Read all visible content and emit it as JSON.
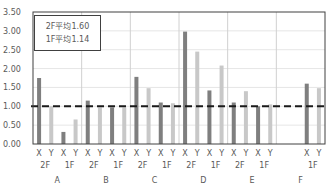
{
  "chart_data": {
    "type": "bar",
    "title": "",
    "xlabel": "",
    "ylabel": "",
    "ylim": [
      0,
      3.5
    ],
    "yticks": [
      "0.00",
      "0.50",
      "1.00",
      "1.50",
      "2.00",
      "2.50",
      "3.00",
      "3.50"
    ],
    "grid": true,
    "reference_line": {
      "value": 1.0,
      "style": "dashed",
      "color": "#1a1a1a"
    },
    "groups": [
      {
        "name": "A",
        "floors": [
          {
            "floor": "2F",
            "X": 1.75,
            "Y": 1.0
          },
          {
            "floor": "1F",
            "X": 0.32,
            "Y": 0.65
          }
        ]
      },
      {
        "name": "B",
        "floors": [
          {
            "floor": "2F",
            "X": 1.15,
            "Y": 0.97
          },
          {
            "floor": "1F",
            "X": 0.97,
            "Y": 0.97
          }
        ]
      },
      {
        "name": "C",
        "floors": [
          {
            "floor": "2F",
            "X": 1.78,
            "Y": 1.48
          },
          {
            "floor": "1F",
            "X": 1.1,
            "Y": 1.08
          }
        ]
      },
      {
        "name": "D",
        "floors": [
          {
            "floor": "2F",
            "X": 2.98,
            "Y": 2.45
          },
          {
            "floor": "1F",
            "X": 1.42,
            "Y": 2.08
          }
        ]
      },
      {
        "name": "E",
        "floors": [
          {
            "floor": "2F",
            "X": 1.1,
            "Y": 1.4
          },
          {
            "floor": "1F",
            "X": 1.0,
            "Y": 1.05
          }
        ]
      },
      {
        "name": "F",
        "floors": [
          {
            "floor": "",
            "X": null,
            "Y": null
          },
          {
            "floor": "1F",
            "X": 1.6,
            "Y": 1.48
          }
        ]
      }
    ],
    "categories": [
      "A-2F-X",
      "A-2F-Y",
      "A-1F-X",
      "A-1F-Y",
      "B-2F-X",
      "B-2F-Y",
      "B-1F-X",
      "B-1F-Y",
      "C-2F-X",
      "C-2F-Y",
      "C-1F-X",
      "C-1F-Y",
      "D-2F-X",
      "D-2F-Y",
      "D-1F-X",
      "D-1F-Y",
      "E-2F-X",
      "E-2F-Y",
      "E-1F-X",
      "E-1F-Y",
      "F-1F-X",
      "F-1F-Y"
    ],
    "values": [
      1.75,
      1.0,
      0.32,
      0.65,
      1.15,
      0.97,
      0.97,
      0.97,
      1.78,
      1.48,
      1.1,
      1.08,
      2.98,
      2.45,
      1.42,
      2.08,
      1.1,
      1.4,
      1.0,
      1.05,
      1.6,
      1.48
    ],
    "legend": {
      "position": "top-left inside plot",
      "entries": [
        "2F平均1.60",
        "1F平均1.14"
      ]
    },
    "colors": {
      "X": "#7f7f7f",
      "Y": "#c8c8c8",
      "gridline": "#e6e6e6",
      "separator": "#d0d0d0",
      "axis": "#404040"
    }
  },
  "legend": {
    "line1": "2F平均1.60",
    "line2": "1F平均1.14"
  }
}
